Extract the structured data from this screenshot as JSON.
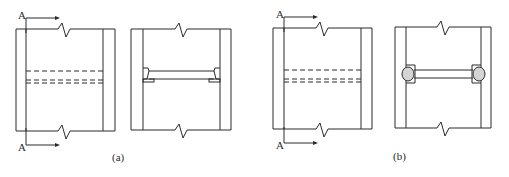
{
  "figure": {
    "panels": [
      {
        "id": "a",
        "caption": "(a)",
        "elevation_view": {
          "section_label_top": "A",
          "section_label_bottom": "A",
          "description": "Wall elevation with coupling beam shown dashed (hidden)"
        },
        "section_view": {
          "description": "Section A-A: coupling beam with haunched ends and bearing plates"
        }
      },
      {
        "id": "b",
        "caption": "(b)",
        "elevation_view": {
          "section_label_top": "A",
          "section_label_bottom": "A",
          "description": "Wall elevation with coupling beam shown dashed (hidden)"
        },
        "section_view": {
          "description": "Section A-A: coupling beam with rounded (hinged) end connections"
        }
      }
    ]
  }
}
